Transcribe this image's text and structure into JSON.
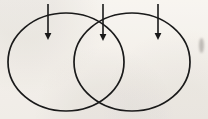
{
  "figure": {
    "width": 208,
    "height": 119,
    "background_color": "#faf8f5",
    "stroke_color": "#1a1a1a",
    "smudge_color": "#96928c"
  },
  "circles": [
    {
      "name": "left-circle",
      "cx": 66,
      "cy": 62,
      "rx": 58,
      "ry": 49,
      "stroke_width": 1.7
    },
    {
      "name": "right-circle",
      "cx": 132,
      "cy": 62,
      "rx": 58,
      "ry": 49,
      "stroke_width": 1.7
    }
  ],
  "arrows": [
    {
      "name": "arrow-left",
      "label": "1",
      "x": 48,
      "y_start": 4,
      "y_end": 40,
      "head_width": 5,
      "head_length": 7
    },
    {
      "name": "arrow-center",
      "label": "2",
      "x": 103,
      "y_start": 4,
      "y_end": 41,
      "head_width": 5,
      "head_length": 7
    },
    {
      "name": "arrow-right",
      "label": "3",
      "x": 158,
      "y_start": 4,
      "y_end": 40,
      "head_width": 5,
      "head_length": 7
    }
  ],
  "intersections": [
    {
      "name": "upper-intersection",
      "x": 103,
      "y": 20
    },
    {
      "name": "lower-intersection",
      "x": 103,
      "y": 104
    }
  ],
  "artifacts": [
    {
      "name": "edge-smudge",
      "x": 199,
      "y": 38,
      "width": 5,
      "height": 15
    }
  ]
}
